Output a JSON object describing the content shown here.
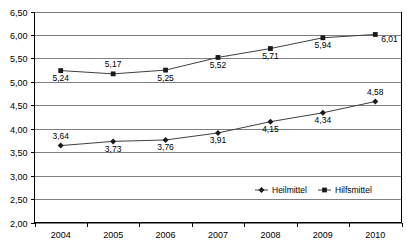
{
  "chart_data": {
    "type": "line",
    "title": "",
    "subtitle": "",
    "xlabel": "",
    "ylabel": "",
    "categories": [
      "2004",
      "2005",
      "2006",
      "2007",
      "2008",
      "2009",
      "2010"
    ],
    "series": [
      {
        "name": "Heilmittel",
        "marker": "diamond",
        "values": [
          3.64,
          3.73,
          3.76,
          3.91,
          4.15,
          4.34,
          4.58
        ],
        "labels": [
          "3,64",
          "3,73",
          "3,76",
          "3,91",
          "4,15",
          "4,34",
          "4,58"
        ],
        "label_positions": [
          "above",
          "below",
          "below",
          "below",
          "below",
          "below",
          "above"
        ]
      },
      {
        "name": "Hilfsmittel",
        "marker": "square",
        "values": [
          5.24,
          5.17,
          5.25,
          5.52,
          5.71,
          5.94,
          6.01
        ],
        "labels": [
          "5,24",
          "5,17",
          "5,25",
          "5,52",
          "5,71",
          "5,94",
          "6,01"
        ],
        "label_positions": [
          "below",
          "above",
          "below",
          "below",
          "below",
          "below",
          "right"
        ]
      }
    ],
    "ylim": [
      2.0,
      6.5
    ],
    "yticks": [
      2.0,
      2.5,
      3.0,
      3.5,
      4.0,
      4.5,
      5.0,
      5.5,
      6.0,
      6.5
    ],
    "ytick_labels": [
      "2,00",
      "2,50",
      "3,00",
      "3,50",
      "4,00",
      "4,50",
      "5,00",
      "5,50",
      "6,00",
      "6,50"
    ],
    "grid": "horizontal",
    "legend_position": "inside-bottom-center",
    "legend_entries": [
      "Heilmittel",
      "Hilfsmittel"
    ],
    "colors": {
      "line": "#3f3f3f",
      "marker": "#1a1a1a",
      "grid": "#808080",
      "axis": "#000000",
      "background": "#ffffff"
    }
  }
}
